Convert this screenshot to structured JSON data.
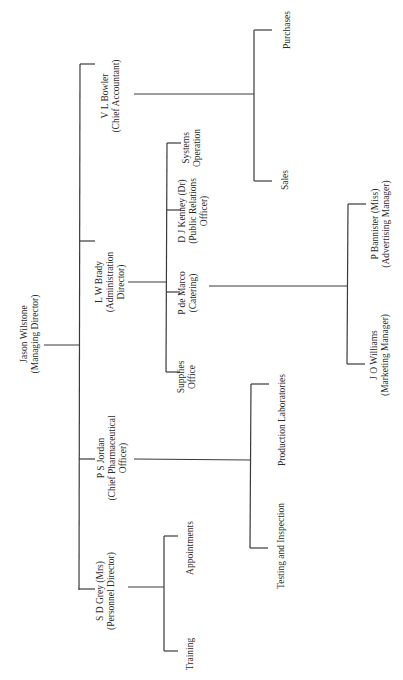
{
  "chart": {
    "orientation": "rotated-90",
    "nodes": {
      "md": {
        "name": "Jason Wilstone",
        "role": "(Managing Director)"
      },
      "bowler": {
        "name": "V L Bowler",
        "role": "(Chief Accountant)"
      },
      "brady": {
        "name": "L W Brady",
        "role": "(Administration",
        "role2": "Director)"
      },
      "jordan": {
        "name": "P S Jordan",
        "role": "(Chief Pharmaceutical",
        "role2": "Officer)"
      },
      "grey": {
        "name": "S D Grey (Mrs)",
        "role": "(Personnel Director)"
      },
      "purchases": {
        "name": "Purchases"
      },
      "sales": {
        "name": "Sales"
      },
      "systems": {
        "name": "Systems",
        "role": "Operation"
      },
      "kenney": {
        "name": "D J Kenney (Dr)",
        "role": "(Public Relations",
        "role2": "Officer)"
      },
      "demarco": {
        "name": "P de Marco",
        "role": "(Catering)"
      },
      "supplies": {
        "name": "Supplies",
        "role": "Office"
      },
      "bannister": {
        "name": "P Bannister (Miss)",
        "role": "(Advertising Manager)"
      },
      "williams": {
        "name": "J O Williams",
        "role": "(Marketing Manager)"
      },
      "production": {
        "name": "Production Laboratories"
      },
      "testing": {
        "name": "Testing and Inspection"
      },
      "appointments": {
        "name": "Appointments"
      },
      "training": {
        "name": "Training"
      }
    },
    "hierarchy": [
      {
        "node": "md",
        "children": [
          {
            "node": "bowler",
            "children": [
              "purchases",
              "sales"
            ]
          },
          {
            "node": "brady",
            "children": [
              "systems",
              {
                "node": "kenney",
                "children": [
                  "bannister",
                  "williams"
                ]
              },
              "demarco",
              "supplies"
            ]
          },
          {
            "node": "jordan",
            "children": [
              "production",
              "testing"
            ]
          },
          {
            "node": "grey",
            "children": [
              "appointments",
              "training"
            ]
          }
        ]
      }
    ]
  }
}
